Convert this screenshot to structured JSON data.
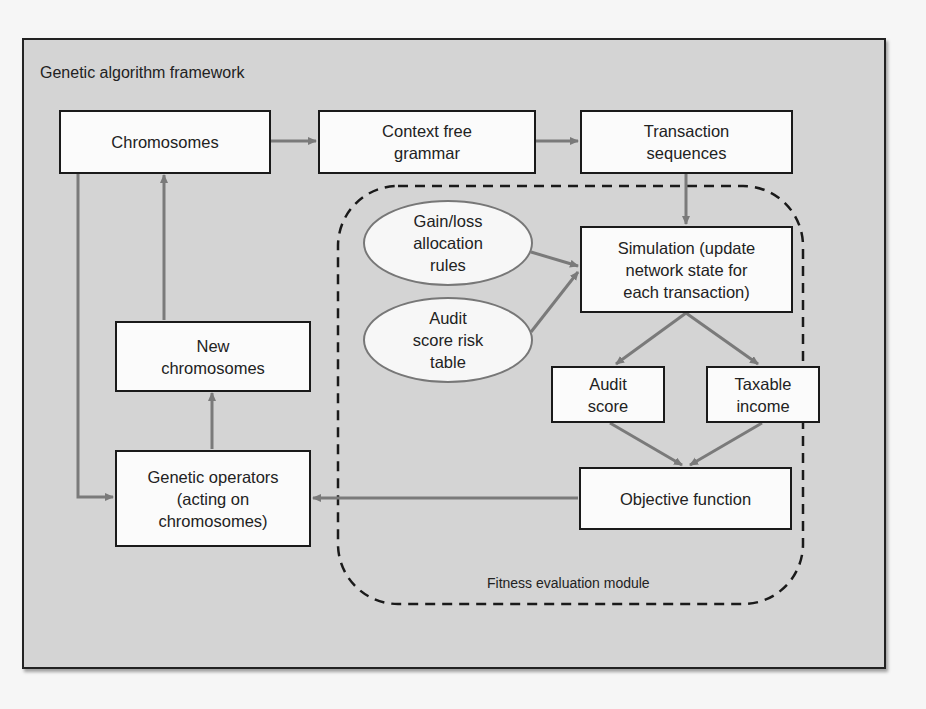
{
  "diagram": {
    "framework_title": "Genetic algorithm framework",
    "module_label": "Fitness evaluation module",
    "colors": {
      "frame_background": "#d4d4d4",
      "box_fill": "#fbfbfb",
      "box_border": "#1a1a1a",
      "arrow": "#7a7a7a",
      "dashed_border": "#1a1a1a"
    },
    "nodes": {
      "chromosomes": "Chromosomes",
      "context_free_grammar": "Context free\ngrammar",
      "transaction_sequences": "Transaction\nsequences",
      "simulation": "Simulation (update\nnetwork state for\neach transaction)",
      "gain_loss_rules": "Gain/loss\nallocation\nrules",
      "audit_score_risk_table": "Audit\nscore risk\ntable",
      "audit_score": "Audit\nscore",
      "taxable_income": "Taxable\nincome",
      "objective_function": "Objective function",
      "new_chromosomes": "New\nchromosomes",
      "genetic_operators": "Genetic operators\n(acting on\nchromosomes)"
    },
    "edges": [
      {
        "from": "Chromosomes",
        "to": "Context free grammar"
      },
      {
        "from": "Context free grammar",
        "to": "Transaction sequences"
      },
      {
        "from": "Transaction sequences",
        "to": "Simulation"
      },
      {
        "from": "Gain/loss allocation rules",
        "to": "Simulation"
      },
      {
        "from": "Audit score risk table",
        "to": "Simulation"
      },
      {
        "from": "Simulation",
        "to": "Audit score"
      },
      {
        "from": "Simulation",
        "to": "Taxable income"
      },
      {
        "from": "Audit score",
        "to": "Objective function"
      },
      {
        "from": "Taxable income",
        "to": "Objective function"
      },
      {
        "from": "Objective function",
        "to": "Genetic operators"
      },
      {
        "from": "Chromosomes",
        "to": "Genetic operators"
      },
      {
        "from": "Genetic operators",
        "to": "New chromosomes"
      },
      {
        "from": "New chromosomes",
        "to": "Chromosomes"
      }
    ]
  }
}
